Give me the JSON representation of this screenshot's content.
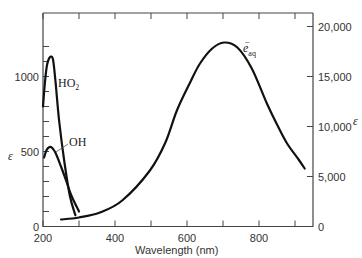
{
  "chart_data": {
    "type": "line",
    "title": "",
    "xlabel": "Wavelength (nm)",
    "ylabel_left": "ε",
    "ylabel_right": "ε",
    "xlim": [
      200,
      950
    ],
    "ylim_left": [
      0,
      1350
    ],
    "ylim_right": [
      0,
      20000
    ],
    "x_ticks": [
      200,
      400,
      600,
      800
    ],
    "x_minor_ticks": [
      300,
      500,
      700,
      900
    ],
    "y_left_ticks": [
      0,
      500,
      1000
    ],
    "y_left_minor_ticks": [
      100,
      200,
      300,
      400,
      600,
      700,
      800,
      900,
      1100,
      1200
    ],
    "y_right_ticks": [
      "0",
      "5,000",
      "10,000",
      "15,000",
      "20,000"
    ],
    "grid": false,
    "series": [
      {
        "name": "HO2",
        "label": "HO₂",
        "axis": "left",
        "x": [
          200,
          205,
          210,
          215,
          222,
          228,
          235,
          245,
          260,
          275,
          290
        ],
        "y": [
          800,
          950,
          1060,
          1110,
          1133,
          1110,
          960,
          700,
          420,
          200,
          75
        ]
      },
      {
        "name": "OH",
        "label": "OH",
        "axis": "left",
        "x": [
          203,
          210,
          218,
          225,
          235,
          250,
          265,
          280,
          300
        ],
        "y": [
          460,
          510,
          530,
          525,
          490,
          400,
          300,
          200,
          100
        ]
      },
      {
        "name": "e_aq",
        "label": "e⁻aq",
        "axis": "right",
        "x": [
          250,
          300,
          358,
          420,
          497,
          540,
          572,
          610,
          636,
          670,
          703,
          740,
          780,
          822,
          850,
          878,
          910,
          927
        ],
        "y": [
          700,
          900,
          1400,
          2600,
          5600,
          8400,
          11600,
          14500,
          16300,
          17800,
          18400,
          17900,
          15800,
          12300,
          10200,
          8300,
          6700,
          5800
        ]
      }
    ],
    "annotations": [
      "HO₂",
      "OH",
      "e⁻aq"
    ]
  }
}
